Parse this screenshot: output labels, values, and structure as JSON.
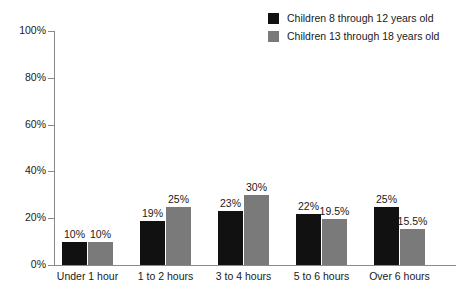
{
  "chart_data": {
    "type": "bar",
    "title": "",
    "subtitle": "",
    "xlabel": "",
    "ylabel": "",
    "ylim": [
      0,
      100
    ],
    "ytick_labels": [
      "100%",
      "80%",
      "60%",
      "40%",
      "20%",
      "0%"
    ],
    "ytick_values": [
      100,
      80,
      60,
      40,
      20,
      0
    ],
    "grid": false,
    "legend_position": "top-right",
    "categories": [
      "Under 1 hour",
      "1 to 2 hours",
      "3 to 4 hours",
      "5 to 6 hours",
      "Over 6 hours"
    ],
    "series": [
      {
        "name": "Children 8 through 12 years old",
        "color": "#111111",
        "values": [
          10,
          19,
          23,
          22,
          25
        ],
        "labels": [
          "10%",
          "19%",
          "23%",
          "22%",
          "25%"
        ]
      },
      {
        "name": "Children 13 through 18 years old",
        "color": "#7a7a7a",
        "values": [
          10,
          25,
          30,
          19.5,
          15.5
        ],
        "labels": [
          "10%",
          "25%",
          "30%",
          "19.5%",
          "15.5%"
        ]
      }
    ]
  },
  "legend": {
    "items": [
      {
        "label": "Children 8 through 12 years old",
        "swatch_name": "legend-swatch-series-1"
      },
      {
        "label": "Children 13 through 18 years old",
        "swatch_name": "legend-swatch-series-2"
      }
    ]
  },
  "colors": {
    "series_1": "#111111",
    "series_2": "#7a7a7a",
    "axis": "#8a8a8a",
    "text": "#1a1a1a",
    "background": "#ffffff"
  }
}
